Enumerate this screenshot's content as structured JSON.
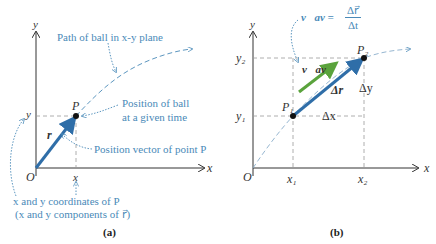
{
  "panel_a": {
    "caption": "(a)",
    "axis_y": "y",
    "axis_x": "x",
    "origin": "O",
    "point": "P",
    "tick_x": "x",
    "tick_y": "y",
    "vector_label": "r⃗",
    "annotations": {
      "path": "Path of ball in x-y plane",
      "position_line1": "Position of ball",
      "position_line2": "at a given time",
      "vector": "Position vector of point P",
      "coords_line1": "x and y coordinates of P",
      "coords_line2": "(x and y components of r⃗)"
    }
  },
  "panel_b": {
    "caption": "(b)",
    "axis_y": "y",
    "axis_x": "x",
    "origin": "O",
    "point1": "P₁",
    "point2": "P₂",
    "tick_x1": "x₁",
    "tick_x2": "x₂",
    "tick_y1": "y₁",
    "tick_y2": "y₂",
    "delta_r": "Δr⃗",
    "delta_x": "Δx",
    "delta_y": "Δy",
    "v_av": "v⃗av",
    "formula_lhs": "v⃗av =",
    "formula_num": "Δr⃗",
    "formula_den": "Δt"
  },
  "colors": {
    "axis": "#333333",
    "vector": "#2f6ea8",
    "velocity": "#5aa33c",
    "annotation": "#4a8ab8",
    "dashed": "#999999"
  }
}
